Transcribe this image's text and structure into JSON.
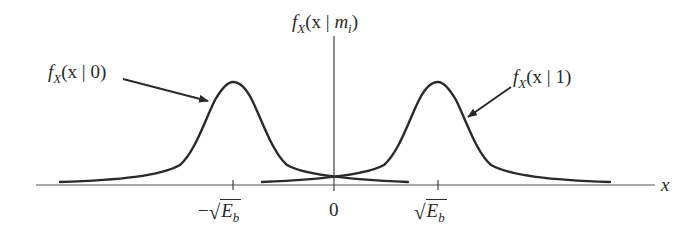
{
  "diagram": {
    "title_label": {
      "func": "f",
      "sub": "X",
      "open": "(x",
      "bar": "|",
      "arg": "m",
      "arg_sub": "i",
      "close": ")"
    },
    "left_label": {
      "func": "f",
      "sub": "X",
      "open": "(x",
      "bar": "|",
      "arg": "0",
      "close": ")"
    },
    "right_label": {
      "func": "f",
      "sub": "X",
      "open": "(x",
      "bar": "|",
      "arg": "1",
      "close": ")"
    },
    "x_axis_label": "x",
    "ticks": [
      {
        "minus": "−",
        "radical": "√",
        "var": "E",
        "sub": "b"
      },
      {
        "value": "0"
      },
      {
        "radical": "√",
        "var": "E",
        "sub": "b"
      }
    ],
    "curves": [
      {
        "name": "f_X(x|0)",
        "center": "-sqrt(E_b)",
        "shape": "bell"
      },
      {
        "name": "f_X(x|1)",
        "center": "sqrt(E_b)",
        "shape": "bell"
      }
    ],
    "colors": {
      "stroke": "#2a2a2a",
      "background": "#ffffff"
    }
  }
}
